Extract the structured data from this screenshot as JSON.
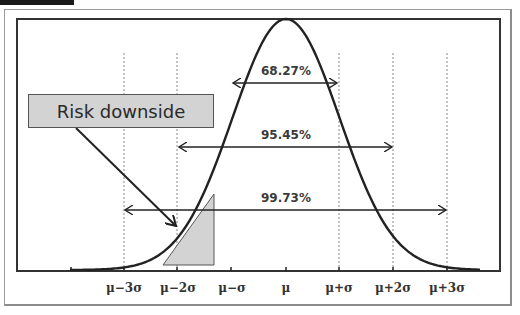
{
  "chart_data": {
    "type": "line",
    "title": "",
    "subtitle": "Normal distribution with standard deviation intervals",
    "xlabel": "",
    "ylabel": "",
    "grid": false,
    "x_tick_labels": [
      "μ−3σ",
      "μ−2σ",
      "μ−σ",
      "μ",
      "μ+σ",
      "μ+2σ",
      "μ+3σ"
    ],
    "x_ticks_sigma": [
      -3,
      -2,
      -1,
      0,
      1,
      2,
      3
    ],
    "xlim_sigma": [
      -4,
      4
    ],
    "series": [
      {
        "name": "Normal density",
        "x": [
          -4,
          -3,
          -2,
          -1,
          0,
          1,
          2,
          3,
          4
        ],
        "y": [
          0.0001,
          0.0044,
          0.054,
          0.242,
          0.399,
          0.242,
          0.054,
          0.0044,
          0.0001
        ]
      }
    ],
    "intervals": [
      {
        "label": "68.27%",
        "from": -1,
        "to": 1
      },
      {
        "label": "95.45%",
        "from": -2,
        "to": 2
      },
      {
        "label": "99.73%",
        "from": -3,
        "to": 3
      }
    ],
    "annotations": [
      {
        "text": "Risk downside",
        "type": "callout-box",
        "points_to": "left tail (shaded triangle near μ−2σ)"
      }
    ],
    "dotted_reference_lines_sigma": [
      -3,
      -2,
      1,
      2,
      3
    ]
  },
  "labels": {
    "ticks": [
      "μ−3σ",
      "μ−2σ",
      "μ−σ",
      "μ",
      "μ+σ",
      "μ+2σ",
      "μ+3σ"
    ],
    "pct_68": "68.27%",
    "pct_95": "95.45%",
    "pct_99": "99.73%",
    "risk": "Risk downside"
  },
  "colors": {
    "curve": "#222222",
    "shade": "#d3d3d3",
    "frame": "#333333",
    "dotted": "#888888"
  }
}
